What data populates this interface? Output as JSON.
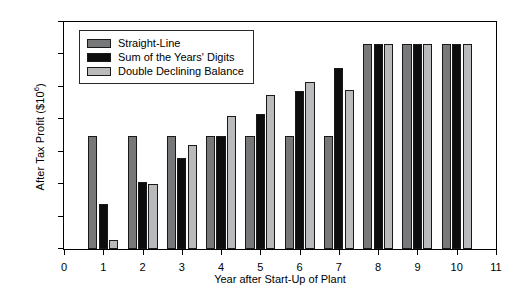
{
  "chart_data": {
    "type": "bar",
    "title": "",
    "xlabel": "Year after Start-Up of Plant",
    "ylabel": "After Tax Profit ($10⁶)",
    "ylabel_base": "After Tax Profit ($10",
    "ylabel_exponent": "6",
    "ylabel_close": ")",
    "categories": [
      "1",
      "2",
      "3",
      "4",
      "5",
      "6",
      "7",
      "8",
      "9",
      "10"
    ],
    "x": [
      1,
      2,
      3,
      4,
      5,
      6,
      7,
      8,
      9,
      10
    ],
    "xlim": [
      0,
      11
    ],
    "ylim": [
      0,
      35
    ],
    "xticks": [
      "0",
      "1",
      "2",
      "3",
      "4",
      "5",
      "6",
      "7",
      "8",
      "9",
      "10",
      "11"
    ],
    "xtick_values": [
      0,
      1,
      2,
      3,
      4,
      5,
      6,
      7,
      8,
      9,
      10,
      11
    ],
    "yticks": [
      "0",
      "5",
      "10",
      "15",
      "20",
      "25",
      "30",
      "35"
    ],
    "ytick_values": [
      0,
      5,
      10,
      15,
      20,
      25,
      30,
      35
    ],
    "grid": false,
    "legend_position": "upper left",
    "series": [
      {
        "name": "Straight-Line",
        "key": "sl",
        "color": "#77787a",
        "values": [
          17.4,
          17.4,
          17.4,
          17.4,
          17.4,
          17.4,
          17.4,
          31.6,
          31.6,
          31.6
        ]
      },
      {
        "name": "Sum of the Years' Digits",
        "key": "syd",
        "color": "#0d0d0d",
        "values": [
          6.9,
          10.3,
          14.0,
          17.4,
          20.8,
          24.4,
          27.9,
          31.6,
          31.6,
          31.6
        ]
      },
      {
        "name": "Double Declining Balance",
        "key": "ddb",
        "color": "#b9babc",
        "values": [
          1.4,
          10.0,
          16.0,
          20.5,
          23.7,
          25.8,
          24.5,
          31.6,
          31.6,
          31.6
        ]
      }
    ]
  }
}
